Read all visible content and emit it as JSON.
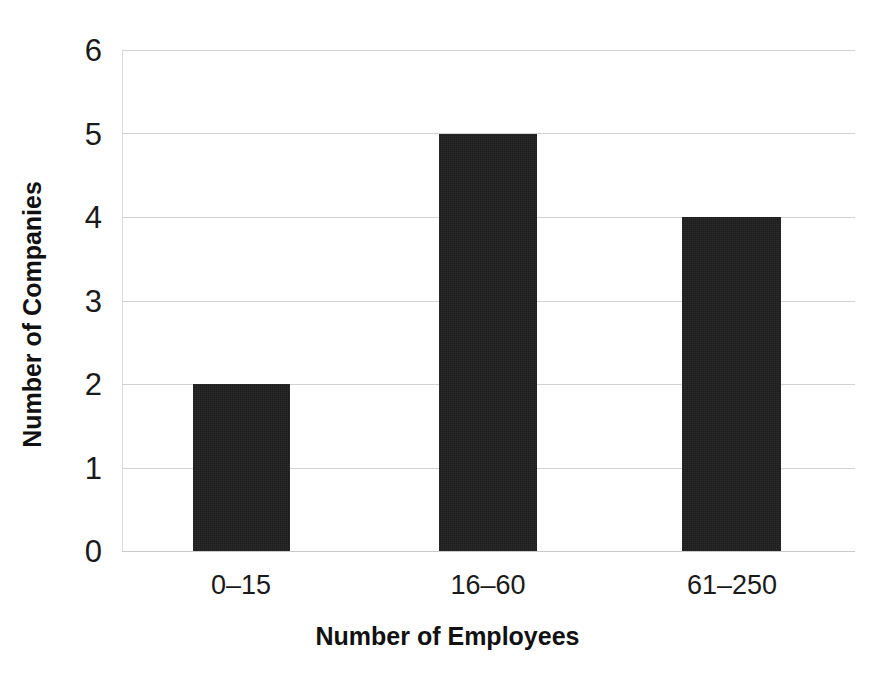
{
  "chart_data": {
    "type": "bar",
    "title": "",
    "subtitle": "",
    "xlabel": "Number of Employees",
    "ylabel": "Number of Companies",
    "categories": [
      "0–15",
      "16–60",
      "61–250"
    ],
    "values": [
      2,
      5,
      4
    ],
    "series": [
      {
        "name": "Number of Companies",
        "values": [
          2,
          5,
          4
        ]
      }
    ],
    "ylim": [
      0,
      6
    ],
    "ytick_labels": [
      "0",
      "1",
      "2",
      "3",
      "4",
      "5",
      "6"
    ],
    "ytick_values": [
      0,
      1,
      2,
      3,
      4,
      5,
      6
    ],
    "xtick_labels": [
      "0–15",
      "16–60",
      "61–250"
    ],
    "grid": true,
    "grid_axis": "y",
    "legend": false,
    "legend_position": "none",
    "annotations": [],
    "colors": {
      "bar": "#1c1c1c",
      "gridline": "#d2d2d2",
      "background": "#ffffff",
      "text": "#1a1a1a",
      "axis_title": "#111111"
    }
  },
  "axis": {
    "y_title": "Number of Companies",
    "x_title": "Number of Employees"
  },
  "yticks": [
    {
      "label": "6",
      "value": 6
    },
    {
      "label": "5",
      "value": 5
    },
    {
      "label": "4",
      "value": 4
    },
    {
      "label": "3",
      "value": 3
    },
    {
      "label": "2",
      "value": 2
    },
    {
      "label": "1",
      "value": 1
    },
    {
      "label": "0",
      "value": 0
    }
  ],
  "bars": [
    {
      "label": "0–15",
      "value": 2
    },
    {
      "label": "16–60",
      "value": 5
    },
    {
      "label": "61–250",
      "value": 4
    }
  ]
}
